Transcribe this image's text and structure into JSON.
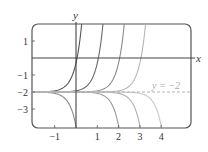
{
  "chart_data": {
    "type": "line",
    "title": "",
    "xlabel": "x",
    "ylabel": "y",
    "xlim": [
      -2.0,
      5.4
    ],
    "ylim": [
      -4.0,
      2.0
    ],
    "x_ticks": [
      -1,
      1,
      2,
      3,
      4
    ],
    "x_tick_labels": [
      "−1",
      "1",
      "2",
      "3",
      "4"
    ],
    "y_ticks": [
      1,
      -1,
      -2,
      -3
    ],
    "y_tick_labels": [
      "1",
      "−1",
      "−2",
      "−3"
    ],
    "grid": false,
    "asymptote": {
      "y": -2,
      "label": "y = −2",
      "style": "dashed"
    },
    "series": [
      {
        "name": "upper curve a=0",
        "shift": 0,
        "direction": "up",
        "shade": "#555555"
      },
      {
        "name": "upper curve a=1",
        "shift": 1,
        "direction": "up",
        "shade": "#6a6a6a"
      },
      {
        "name": "upper curve a=2",
        "shift": 2,
        "direction": "up",
        "shade": "#8a8a8a"
      },
      {
        "name": "upper curve a=3",
        "shift": 3,
        "direction": "up",
        "shade": "#b5b5b5"
      },
      {
        "name": "lower curve a=0",
        "shift": 0,
        "direction": "down",
        "shade": "#8a8a8a"
      },
      {
        "name": "lower curve a=2",
        "shift": 2,
        "direction": "down",
        "shade": "#9a9a9a"
      },
      {
        "name": "lower curve a=3",
        "shift": 3,
        "direction": "down",
        "shade": "#b0b0b0"
      },
      {
        "name": "lower curve a=4",
        "shift": 4,
        "direction": "down",
        "shade": "#c8c8c8"
      }
    ]
  },
  "labels": {
    "x_axis": "x",
    "y_axis": "y",
    "asymptote": "y = −2"
  }
}
